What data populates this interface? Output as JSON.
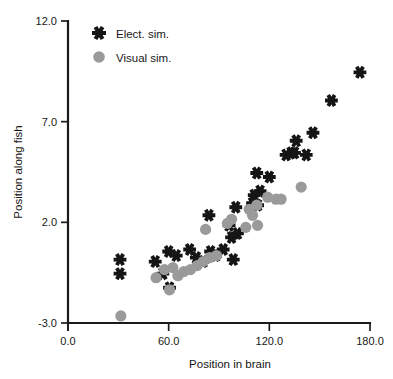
{
  "chart_data": {
    "type": "scatter",
    "title": "",
    "xlabel": "Position in brain",
    "ylabel": "Position along fish",
    "xlim": [
      0.0,
      180.0
    ],
    "ylim": [
      -3.0,
      12.0
    ],
    "xticks": [
      "0.0",
      "60.0",
      "120.0",
      "180.0"
    ],
    "xtick_values": [
      0.0,
      60.0,
      120.0,
      180.0
    ],
    "yticks": [
      "12.0",
      "7.0",
      "2.0",
      "-3.0"
    ],
    "ytick_values": [
      12.0,
      7.0,
      2.0,
      -3.0
    ],
    "grid": false,
    "legend_position": "top-left-inside",
    "series": [
      {
        "name": "Elect. sim.",
        "marker": "asterisk",
        "color": "#151515",
        "points": [
          [
            31.0,
            0.15
          ],
          [
            31.0,
            -0.55
          ],
          [
            52.0,
            0.05
          ],
          [
            56.5,
            -0.55
          ],
          [
            60.0,
            0.55
          ],
          [
            60.5,
            -1.25
          ],
          [
            64.5,
            0.35
          ],
          [
            72.5,
            0.65
          ],
          [
            76.5,
            0.25
          ],
          [
            80.5,
            0.05
          ],
          [
            84.0,
            2.35
          ],
          [
            85.0,
            0.55
          ],
          [
            88.0,
            0.35
          ],
          [
            92.5,
            0.65
          ],
          [
            96.0,
            1.85
          ],
          [
            97.5,
            1.25
          ],
          [
            98.5,
            0.15
          ],
          [
            100.0,
            2.75
          ],
          [
            101.0,
            1.45
          ],
          [
            110.0,
            2.95
          ],
          [
            111.0,
            3.35
          ],
          [
            112.5,
            4.45
          ],
          [
            113.0,
            2.85
          ],
          [
            114.5,
            3.55
          ],
          [
            120.0,
            4.25
          ],
          [
            130.0,
            5.35
          ],
          [
            133.0,
            5.45
          ],
          [
            135.0,
            5.45
          ],
          [
            136.0,
            6.05
          ],
          [
            142.0,
            5.35
          ],
          [
            146.0,
            6.45
          ],
          [
            157.0,
            8.05
          ],
          [
            174.0,
            9.45
          ]
        ]
      },
      {
        "name": "Visual sim.",
        "marker": "circle",
        "color": "#9a9a9a",
        "points": [
          [
            31.5,
            -2.65
          ],
          [
            52.5,
            -0.75
          ],
          [
            57.5,
            -0.35
          ],
          [
            60.5,
            -1.35
          ],
          [
            62.5,
            -0.25
          ],
          [
            65.5,
            -0.65
          ],
          [
            69.0,
            -0.45
          ],
          [
            73.0,
            -0.35
          ],
          [
            77.0,
            -0.15
          ],
          [
            80.5,
            0.05
          ],
          [
            82.0,
            1.65
          ],
          [
            84.5,
            0.25
          ],
          [
            88.5,
            0.35
          ],
          [
            95.0,
            1.95
          ],
          [
            97.5,
            2.15
          ],
          [
            106.0,
            1.75
          ],
          [
            108.0,
            2.65
          ],
          [
            110.0,
            2.35
          ],
          [
            112.5,
            2.85
          ],
          [
            113.0,
            1.85
          ],
          [
            119.0,
            3.25
          ],
          [
            124.0,
            3.15
          ],
          [
            127.0,
            3.15
          ],
          [
            139.0,
            3.75
          ]
        ]
      }
    ]
  },
  "legend": {
    "entries": [
      {
        "label": "Elect. sim.",
        "marker": "asterisk"
      },
      {
        "label": "Visual sim.",
        "marker": "circle"
      }
    ]
  },
  "colors": {
    "axis": "#1a1a1a",
    "text": "#181818",
    "elect_marker": "#151515",
    "visual_marker": "#9a9a9a",
    "background": "#ffffff"
  }
}
